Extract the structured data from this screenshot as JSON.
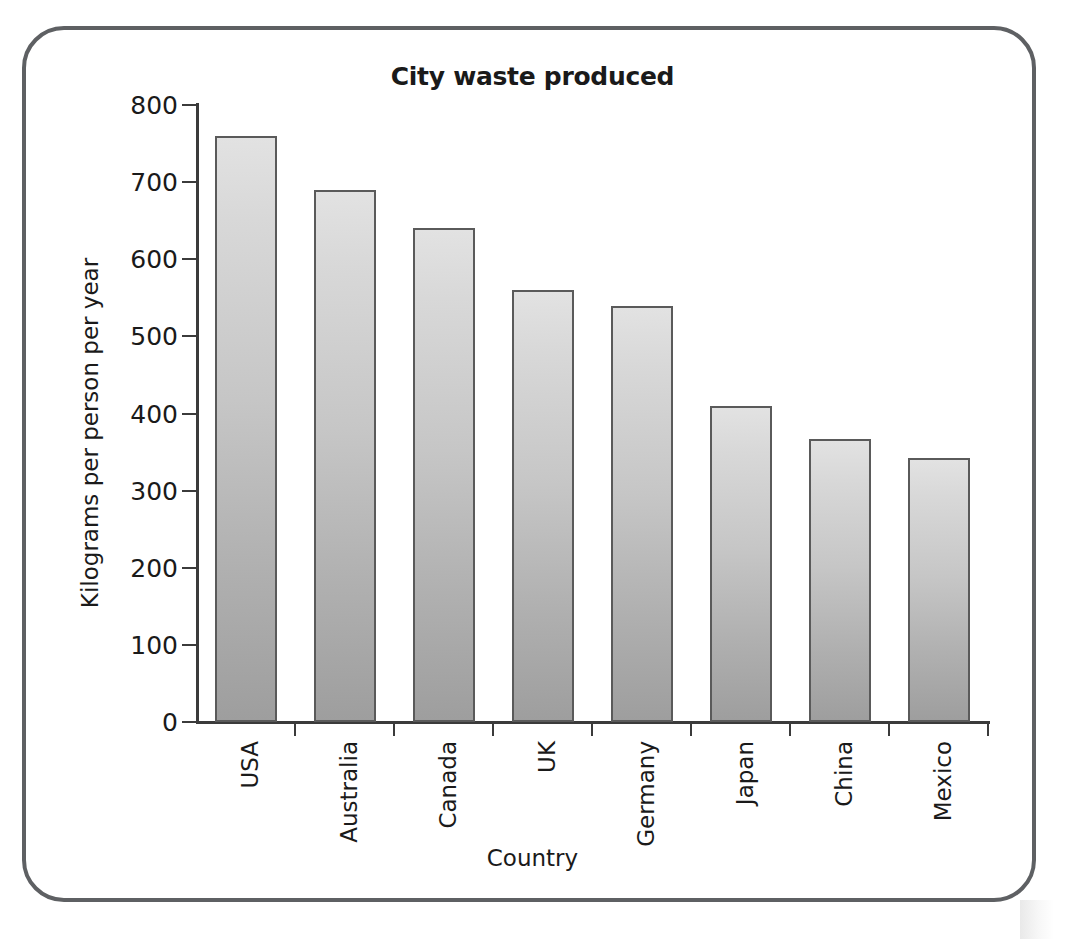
{
  "chart_data": {
    "type": "bar",
    "title": "City waste produced",
    "xlabel": "Country",
    "ylabel": "Kilograms per person per year",
    "categories": [
      "USA",
      "Australia",
      "Canada",
      "UK",
      "Germany",
      "Japan",
      "China",
      "Mexico"
    ],
    "values": [
      760,
      690,
      640,
      560,
      540,
      410,
      367,
      342
    ],
    "ylim": [
      0,
      800
    ],
    "yticks": [
      0,
      100,
      200,
      300,
      400,
      500,
      600,
      700,
      800
    ],
    "ytick_labels": [
      "0",
      "100",
      "200",
      "300",
      "400",
      "500",
      "600",
      "700",
      "800"
    ],
    "grid": false,
    "legend": false,
    "bar_fill_top": "#e2e2e2",
    "bar_fill_bottom": "#9e9e9e",
    "bar_border_color": "#5a5a5a",
    "axis_color": "#3b3b3b",
    "frame_color": "#5e6063",
    "background": "#ffffff"
  }
}
